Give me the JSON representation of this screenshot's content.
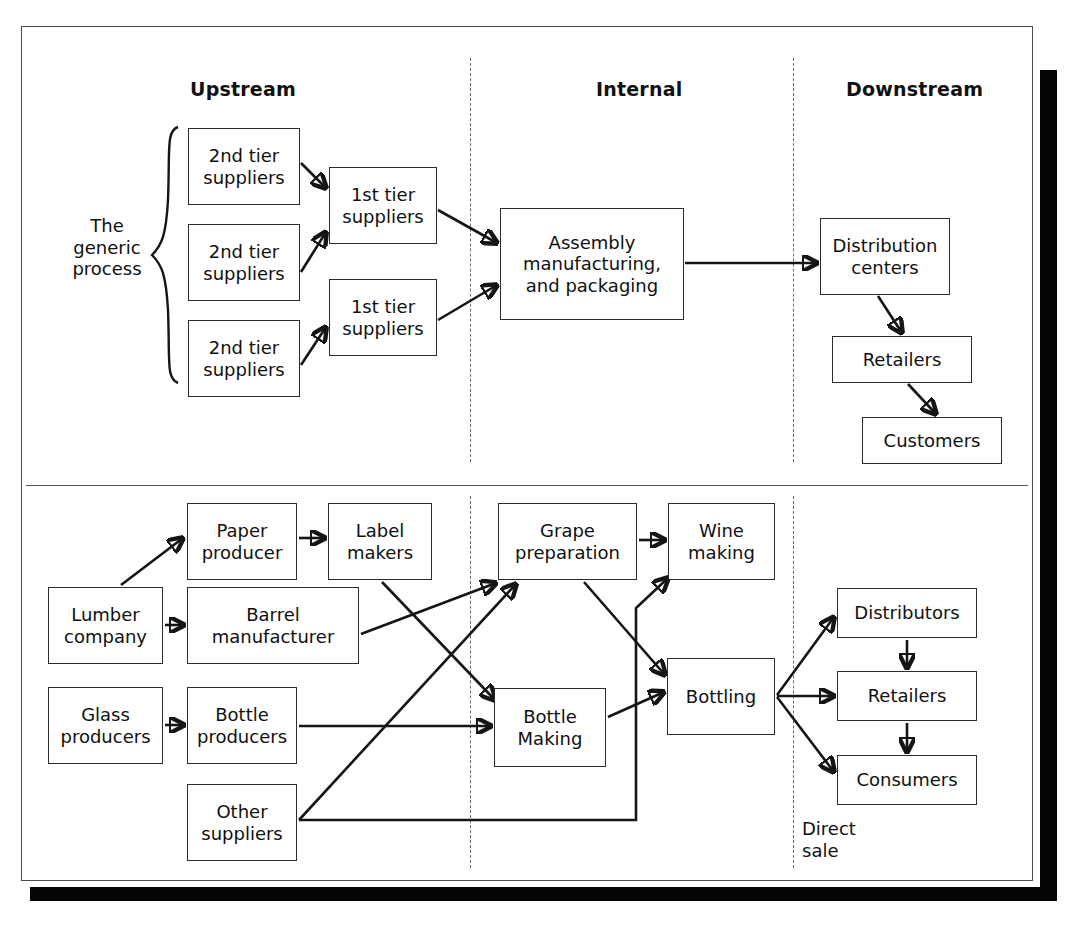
{
  "figure": {
    "column_headers": [
      {
        "label": "Upstream"
      },
      {
        "label": "Internal"
      },
      {
        "label": "Downstream"
      }
    ]
  },
  "generic_process": {
    "brace_label": "The\ngeneric\nprocess",
    "nodes": [
      {
        "id": "t2a",
        "label": "2nd tier\nsuppliers"
      },
      {
        "id": "t2b",
        "label": "2nd tier\nsuppliers"
      },
      {
        "id": "t2c",
        "label": "2nd tier\nsuppliers"
      },
      {
        "id": "t1a",
        "label": "1st tier\nsuppliers"
      },
      {
        "id": "t1b",
        "label": "1st tier\nsuppliers"
      },
      {
        "id": "assembly",
        "label": "Assembly\nmanufacturing,\nand packaging"
      },
      {
        "id": "dc",
        "label": "Distribution\ncenters"
      },
      {
        "id": "retailers",
        "label": "Retailers"
      },
      {
        "id": "customers",
        "label": "Customers"
      }
    ],
    "edges": [
      {
        "from": "t2a",
        "to": "t1a"
      },
      {
        "from": "t2b",
        "to": "t1a"
      },
      {
        "from": "t2c",
        "to": "t1b"
      },
      {
        "from": "t1a",
        "to": "assembly"
      },
      {
        "from": "t1b",
        "to": "assembly"
      },
      {
        "from": "assembly",
        "to": "dc"
      },
      {
        "from": "dc",
        "to": "retailers"
      },
      {
        "from": "retailers",
        "to": "customers"
      }
    ]
  },
  "wine_process": {
    "nodes": [
      {
        "id": "lumber",
        "label": "Lumber\ncompany"
      },
      {
        "id": "glass",
        "label": "Glass\nproducers"
      },
      {
        "id": "paper",
        "label": "Paper\nproducer"
      },
      {
        "id": "barrel",
        "label": "Barrel\nmanufacturer"
      },
      {
        "id": "bottleprod",
        "label": "Bottle\nproducers"
      },
      {
        "id": "other",
        "label": "Other\nsuppliers"
      },
      {
        "id": "labels",
        "label": "Label\nmakers"
      },
      {
        "id": "grape",
        "label": "Grape\npreparation"
      },
      {
        "id": "wine",
        "label": "Wine\nmaking"
      },
      {
        "id": "bottlemaking",
        "label": "Bottle\nMaking"
      },
      {
        "id": "bottling",
        "label": "Bottling"
      },
      {
        "id": "distributors",
        "label": "Distributors"
      },
      {
        "id": "wretailers",
        "label": "Retailers"
      },
      {
        "id": "consumers",
        "label": "Consumers"
      }
    ],
    "annotations": [
      {
        "id": "direct-sale",
        "label": "Direct\nsale"
      }
    ],
    "edges": [
      {
        "from": "lumber",
        "to": "paper"
      },
      {
        "from": "lumber",
        "to": "barrel"
      },
      {
        "from": "glass",
        "to": "bottleprod"
      },
      {
        "from": "paper",
        "to": "labels"
      },
      {
        "from": "labels",
        "to": "bottlemaking"
      },
      {
        "from": "barrel",
        "to": "grape"
      },
      {
        "from": "bottleprod",
        "to": "bottlemaking"
      },
      {
        "from": "other",
        "to": "grape"
      },
      {
        "from": "other",
        "to": "wine"
      },
      {
        "from": "grape",
        "to": "wine"
      },
      {
        "from": "grape",
        "to": "bottling"
      },
      {
        "from": "bottlemaking",
        "to": "bottling"
      },
      {
        "from": "bottling",
        "to": "distributors"
      },
      {
        "from": "bottling",
        "to": "wretailers"
      },
      {
        "from": "bottling",
        "to": "consumers"
      },
      {
        "from": "distributors",
        "to": "wretailers"
      },
      {
        "from": "wretailers",
        "to": "consumers"
      }
    ]
  },
  "colors": {
    "background": "#ffffff",
    "frame_border": "#4c4c4c",
    "shadow": "#050505",
    "node_border": "#2b2b2b",
    "arrow": "#151515",
    "divider": "#6a6a6a",
    "text": "#101010"
  }
}
